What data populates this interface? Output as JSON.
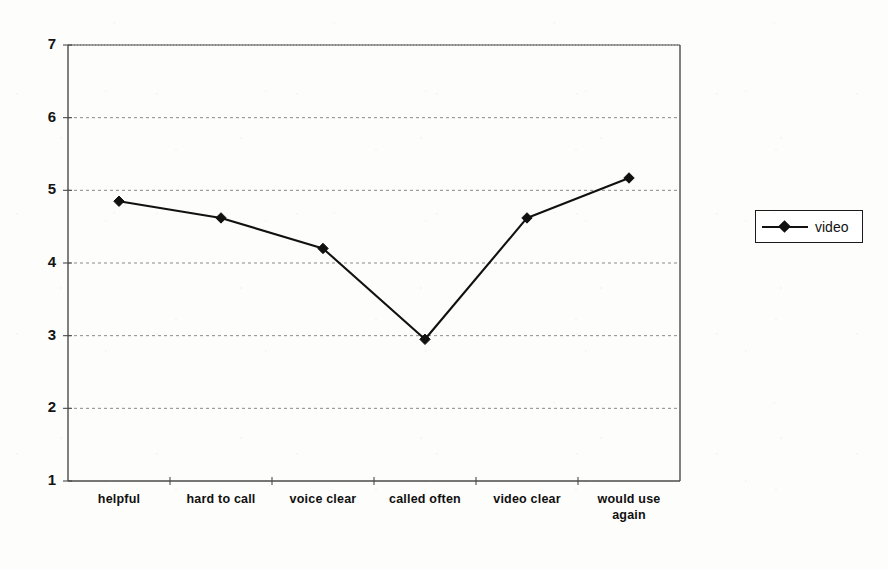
{
  "chart_data": {
    "type": "line",
    "title": "",
    "subtitle": "",
    "xlabel": "",
    "ylabel": "",
    "categories": [
      "helpful",
      "hard to call",
      "voice clear",
      "called often",
      "video clear",
      "would use again"
    ],
    "series": [
      {
        "name": "video",
        "values": [
          4.85,
          4.62,
          4.2,
          2.95,
          4.62,
          5.17
        ],
        "color": "#111111",
        "marker": "diamond"
      }
    ],
    "ylim": [
      1,
      7
    ],
    "yticks": [
      1,
      2,
      3,
      4,
      5,
      6,
      7
    ],
    "ytick_labels": [
      "1",
      "2",
      "3",
      "4",
      "5",
      "6",
      "7"
    ],
    "grid": {
      "horizontal": true,
      "vertical": false,
      "style": "dotted",
      "color": "#8a8a8a"
    },
    "legend": {
      "position": "right",
      "entries": [
        "video"
      ]
    },
    "axis_color": "#4a4a4a"
  },
  "legend": {
    "video_label": "video"
  },
  "axes": {
    "y_labels": [
      "7",
      "6",
      "5",
      "4",
      "3",
      "2",
      "1"
    ],
    "x_labels": [
      "helpful",
      "hard to call",
      "voice clear",
      "called often",
      "video clear",
      "would use\nagain"
    ]
  }
}
